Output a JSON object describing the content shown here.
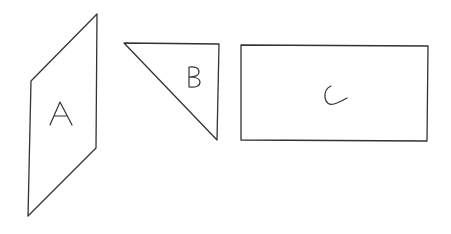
{
  "diagram": {
    "type": "geometric shapes",
    "shapes": [
      {
        "id": "A",
        "label": "A",
        "kind": "parallelogram"
      },
      {
        "id": "B",
        "label": "B",
        "kind": "right triangle"
      },
      {
        "id": "C",
        "label": "C",
        "kind": "rectangle"
      }
    ],
    "colors": {
      "stroke": "#333333",
      "background": "#ffffff"
    }
  }
}
